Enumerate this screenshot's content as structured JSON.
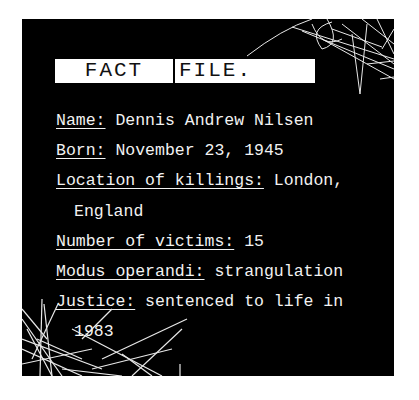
{
  "header": {
    "label_left": "FACT",
    "label_right": "FILE."
  },
  "facts": [
    {
      "key": "Name:",
      "value": " Dennis Andrew Nilsen"
    },
    {
      "key": "Born:",
      "value": " November 23, 1945"
    },
    {
      "key": "Location of killings:",
      "value": " London,"
    },
    {
      "continuation": "England"
    },
    {
      "key": "Number of victims:",
      "value": " 15"
    },
    {
      "key": "Modus operandi:",
      "value": " strangulation"
    },
    {
      "key": "Justice:",
      "value": " sentenced to life in"
    },
    {
      "continuation": "1983"
    }
  ],
  "colors": {
    "background": "#000000",
    "text": "#f2f2f2",
    "label_bg": "#ffffff"
  }
}
